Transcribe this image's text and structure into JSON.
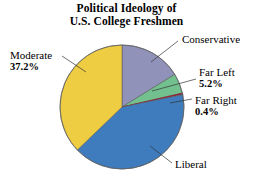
{
  "title": {
    "line1": "Political Ideology of",
    "line2": "U.S. College Freshmen"
  },
  "labels": {
    "moderate": {
      "name": "Moderate",
      "pct": "37.2%"
    },
    "conservative": {
      "name": "Conservative",
      "pct": ""
    },
    "far_left": {
      "name": "Far Left",
      "pct": "5.2%"
    },
    "far_right": {
      "name": "Far Right",
      "pct": "0.4%"
    },
    "liberal": {
      "name": "Liberal",
      "pct": ""
    }
  },
  "colors": {
    "moderate": "#EFCD43",
    "conservative": "#9192B9",
    "far_left": "#73C08F",
    "far_right": "#8E2230",
    "liberal": "#3F7CBE",
    "outline": "#5A5A5A",
    "leader": "#333333",
    "background": "#FFFFFF"
  },
  "chart_data": {
    "type": "pie",
    "title": "Political Ideology of U.S. College Freshmen",
    "categories": [
      "Conservative",
      "Far Left",
      "Far Right",
      "Liberal",
      "Moderate"
    ],
    "values": [
      16.2,
      5.2,
      0.4,
      41.0,
      37.2
    ],
    "value_unit": "percent",
    "labels_shown": [
      "Moderate 37.2%",
      "Conservative",
      "Far Left 5.2%",
      "Far Right 0.4%",
      "Liberal"
    ],
    "slice_colors": [
      "#9192B9",
      "#73C08F",
      "#8E2230",
      "#3F7CBE",
      "#EFCD43"
    ],
    "start_angle_deg": 0,
    "direction": "clockwise",
    "legend": "none",
    "grid": false,
    "center": [
      122,
      107
    ],
    "radius": 62
  }
}
